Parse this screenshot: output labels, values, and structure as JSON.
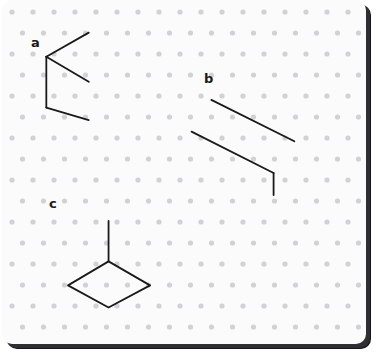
{
  "app": {
    "name": "geoboard-canvas",
    "background_color": "#ffffff",
    "card_color": "#fbfbfb",
    "border_shadow_color": "#17171a"
  },
  "grid": {
    "type": "isometric-dot-grid",
    "dot_color": "#d2d2d6",
    "dot_radius": 2.6,
    "column_spacing": 21,
    "row_spacing": 21,
    "stagger_offset_x": 10.5,
    "origin_x": 10,
    "origin_y": 12
  },
  "stroke": {
    "color": "#1a1a1a",
    "width": 1.9,
    "linecap": "round",
    "linejoin": "round"
  },
  "figures": [
    {
      "label": "a",
      "label_x": 29,
      "label_y": 36,
      "paths": [
        {
          "name": "a-upper-arm",
          "points": "92,34 47,59"
        },
        {
          "name": "a-middle-arm",
          "points": "47,59 92,85"
        },
        {
          "name": "a-vertical-stem",
          "points": "47,59 47,112"
        },
        {
          "name": "a-lower-arm",
          "points": "47,112 92,125"
        }
      ]
    },
    {
      "label": "b",
      "label_x": 202,
      "label_y": 72,
      "paths": [
        {
          "name": "b-upper-diagonal",
          "points": "222,104 310,147"
        },
        {
          "name": "b-lower-diagonal",
          "points": "201,137 288,180"
        },
        {
          "name": "b-vertical-tail",
          "points": "288,180 288,203"
        }
      ]
    },
    {
      "label": "c",
      "label_x": 47,
      "label_y": 197,
      "paths": [
        {
          "name": "c-vertical-stem",
          "points": "113,230 113,272"
        },
        {
          "name": "c-rhombus",
          "points": "113,272 157,297 113,320 70,297 113,272"
        }
      ]
    }
  ]
}
